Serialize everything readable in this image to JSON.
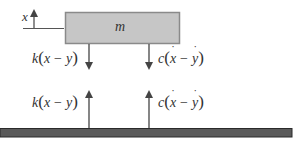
{
  "diagram": {
    "mass": {
      "label": "m",
      "fill": "#c6c6c6",
      "stroke": "#8a8a8a"
    },
    "coordinate": {
      "label": "x"
    },
    "ground": {
      "fill": "#5a5a5a",
      "stroke": "#2a2a2a"
    },
    "arrow_color": "#444444",
    "forces": {
      "spring_on_mass": {
        "coef": "k",
        "open": "(",
        "a": "x",
        "op": "−",
        "b": "y",
        "close": ")",
        "direction": "down"
      },
      "damper_on_mass": {
        "coef": "c",
        "open": "(",
        "a": "x",
        "op": "−",
        "b": "y",
        "close": ")",
        "dotted": true,
        "direction": "down"
      },
      "spring_on_ground": {
        "coef": "k",
        "open": "(",
        "a": "x",
        "op": "−",
        "b": "y",
        "close": ")",
        "direction": "up"
      },
      "damper_on_ground": {
        "coef": "c",
        "open": "(",
        "a": "x",
        "op": "−",
        "b": "y",
        "close": ")",
        "dotted": true,
        "direction": "up"
      }
    }
  }
}
